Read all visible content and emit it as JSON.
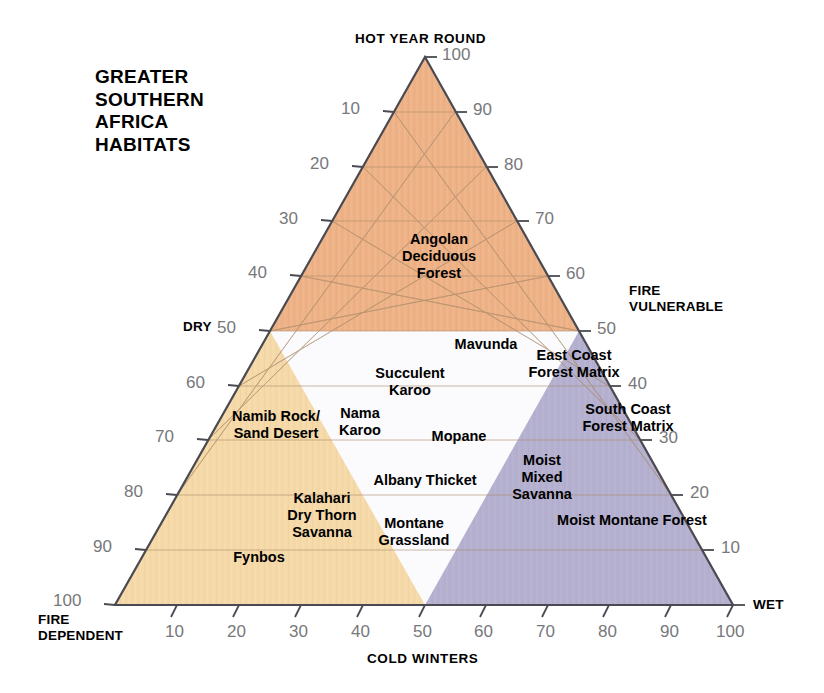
{
  "title": "GREATER\nSOUTHERN\nAFRICA\nHABITATS",
  "corners": {
    "top": "HOT YEAR ROUND",
    "bottom_left": "FIRE\nDEPENDENT",
    "bottom_right": "WET",
    "left_mid": "DRY",
    "right_mid": "FIRE\nVULNERABLE"
  },
  "axes": {
    "bottom_name": "COLD WINTERS",
    "left_ticks": [
      "10",
      "20",
      "30",
      "40",
      "50",
      "60",
      "70",
      "80",
      "90",
      "100"
    ],
    "right_ticks": [
      "100",
      "90",
      "80",
      "70",
      "60",
      "50",
      "40",
      "30",
      "20",
      "10"
    ],
    "bottom_ticks": [
      "10",
      "20",
      "30",
      "40",
      "50",
      "60",
      "70",
      "80",
      "90",
      "100"
    ]
  },
  "colors": {
    "dry_region": "#f5d9a8",
    "hot_region": "#eeb287",
    "wet_region": "#b5b0cf",
    "neutral_region": "#fbfbfd",
    "grid": "#a98a6a",
    "outline": "#4a4a52",
    "tick_text": "#77787b"
  },
  "chart_data": {
    "type": "ternary-scatter",
    "title": "GREATER SOUTHERN AFRICA HABITATS",
    "axis_top": "HOT YEAR ROUND",
    "axis_left": "DRY",
    "axis_right": "WET",
    "axis_bottom": "COLD WINTERS",
    "corner_bottom_left": "FIRE DEPENDENT",
    "corner_right": "FIRE VULNERABLE",
    "axis_range": [
      0,
      100
    ],
    "grid": true,
    "regions": [
      {
        "name": "hot year round zone",
        "color": "#eeb287",
        "description": "upper band above 50% hot-year-round"
      },
      {
        "name": "dry fire-dependent zone",
        "color": "#f5d9a8",
        "description": "lower-left zone, dry and fire dependent"
      },
      {
        "name": "wet fire-vulnerable zone",
        "color": "#b5b0cf",
        "description": "lower-right zone, wet and fire vulnerable"
      },
      {
        "name": "temperate neutral zone",
        "color": "#fbfbfd",
        "description": "central unshaded zone"
      }
    ],
    "labels": [
      {
        "text": "Angolan\nDeciduous\nForest",
        "hot": 68,
        "cold": 30,
        "wet": 2
      },
      {
        "text": "Mavunda",
        "hot": 47,
        "cold": 43,
        "wet": 10
      },
      {
        "text": "East Coast\nForest Matrix",
        "hot": 44,
        "cold": 28,
        "wet": 28
      },
      {
        "text": "Succulent\nKaroo",
        "hot": 40,
        "cold": 22,
        "wet": 38
      },
      {
        "text": "South Coast\nForest Matrix",
        "hot": 34,
        "cold": 28,
        "wet": 38
      },
      {
        "text": "Namib Rock/\nSand Desert",
        "hot": 33,
        "cold": 12,
        "wet": 55
      },
      {
        "text": "Nama\nKaroo",
        "hot": 33,
        "cold": 28,
        "wet": 39
      },
      {
        "text": "Mopane",
        "hot": 27,
        "cold": 45,
        "wet": 28
      },
      {
        "text": "Moist\nMixed\nSavanna",
        "hot": 24,
        "cold": 46,
        "wet": 30
      },
      {
        "text": "Albany Thicket",
        "hot": 21,
        "cold": 38,
        "wet": 41
      },
      {
        "text": "Kalahari\nDry Thorn\nSavanna",
        "hot": 16,
        "cold": 28,
        "wet": 56
      },
      {
        "text": "Moist Montane Forest",
        "hot": 14,
        "cold": 62,
        "wet": 24
      },
      {
        "text": "Montane\nGrassland",
        "hot": 13,
        "cold": 40,
        "wet": 47
      },
      {
        "text": "Fynbos",
        "hot": 8,
        "cold": 25,
        "wet": 67
      }
    ]
  },
  "habitats": [
    {
      "name": "angolan-deciduous-forest",
      "text": "Angolan\nDeciduous\nForest",
      "x": 439,
      "y": 256
    },
    {
      "name": "mavunda",
      "text": "Mavunda",
      "x": 486,
      "y": 344
    },
    {
      "name": "east-coast-forest-matrix",
      "text": "East Coast\nForest Matrix",
      "x": 574,
      "y": 364
    },
    {
      "name": "succulent-karoo",
      "text": "Succulent\nKaroo",
      "x": 410,
      "y": 382
    },
    {
      "name": "south-coast-forest-matrix",
      "text": "South Coast\nForest Matrix",
      "x": 628,
      "y": 418
    },
    {
      "name": "namib-rock-sand-desert",
      "text": "Namib Rock/\nSand Desert",
      "x": 276,
      "y": 425
    },
    {
      "name": "nama-karoo",
      "text": "Nama\nKaroo",
      "x": 360,
      "y": 422
    },
    {
      "name": "mopane",
      "text": "Mopane",
      "x": 459,
      "y": 436
    },
    {
      "name": "moist-mixed-savanna",
      "text": "Moist\nMixed\nSavanna",
      "x": 542,
      "y": 477
    },
    {
      "name": "albany-thicket",
      "text": "Albany Thicket",
      "x": 425,
      "y": 480
    },
    {
      "name": "kalahari-dry-thorn-savanna",
      "text": "Kalahari\nDry Thorn\nSavanna",
      "x": 322,
      "y": 515
    },
    {
      "name": "moist-montane-forest",
      "text": "Moist Montane Forest",
      "x": 632,
      "y": 520
    },
    {
      "name": "montane-grassland",
      "text": "Montane\nGrassland",
      "x": 414,
      "y": 532
    },
    {
      "name": "fynbos",
      "text": "Fynbos",
      "x": 259,
      "y": 557
    }
  ]
}
